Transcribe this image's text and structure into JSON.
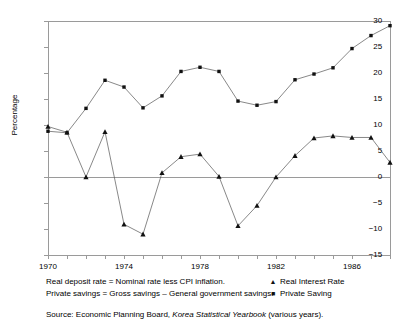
{
  "chart_data": {
    "type": "line",
    "title": "",
    "xlabel": "",
    "ylabel": "Percentage",
    "ylim": [
      -15,
      30
    ],
    "xlim": [
      1970,
      1988
    ],
    "yticks": [
      -15,
      -10,
      -5,
      0,
      5,
      10,
      15,
      20,
      25,
      30
    ],
    "ytick_labels": [
      "−15",
      "−10",
      "−5",
      "0",
      "5",
      "10",
      "15",
      "20",
      "25",
      "30"
    ],
    "xticks": [
      1970,
      1971,
      1972,
      1973,
      1974,
      1975,
      1976,
      1977,
      1978,
      1979,
      1980,
      1981,
      1982,
      1983,
      1984,
      1985,
      1986,
      1987,
      1988
    ],
    "xtick_labels_shown": [
      "1970",
      "1974",
      "1978",
      "1982",
      "1986"
    ],
    "xtick_labels_shown_values": [
      1970,
      1974,
      1978,
      1982,
      1986
    ],
    "grid": false,
    "reference_lines": [
      0,
      30
    ],
    "legend_position": "below-right",
    "x": [
      1970,
      1971,
      1972,
      1973,
      1974,
      1975,
      1976,
      1977,
      1978,
      1979,
      1980,
      1981,
      1982,
      1983,
      1984,
      1985,
      1986,
      1987,
      1988
    ],
    "series": [
      {
        "name": "Real Interest Rate",
        "marker": "triangle",
        "values": [
          9.7,
          8.6,
          0.0,
          8.7,
          -9.1,
          -11.0,
          0.8,
          3.9,
          4.4,
          0.1,
          -9.4,
          -5.5,
          0.0,
          4.1,
          7.5,
          7.9,
          7.6,
          7.6,
          2.8
        ]
      },
      {
        "name": "Private Saving",
        "marker": "square",
        "values": [
          8.8,
          8.5,
          13.2,
          18.6,
          17.3,
          13.3,
          15.6,
          20.3,
          21.1,
          20.3,
          14.6,
          13.8,
          14.5,
          18.7,
          19.8,
          21.0,
          24.7,
          27.2,
          29.1
        ]
      }
    ]
  },
  "axis": {
    "y_title": "Percentage"
  },
  "legend": {
    "entries": [
      {
        "marker_glyph": "▲",
        "label": "Real Interest Rate"
      },
      {
        "marker_glyph": "■",
        "label": "Private Saving"
      }
    ]
  },
  "footnotes": [
    "Real deposit rate = Nominal rate less CPI inflation.",
    "Private savings = Gross savings – General government savings."
  ],
  "source": {
    "prefix": "Source: Economic Planning Board, ",
    "italic_title": "Korea Statistical Yearbook",
    "suffix": " (various years)."
  },
  "colors": {
    "line": "#555555",
    "marker": "#111111",
    "axis": "#9a9a9a",
    "text": "#000000",
    "background": "#ffffff"
  }
}
